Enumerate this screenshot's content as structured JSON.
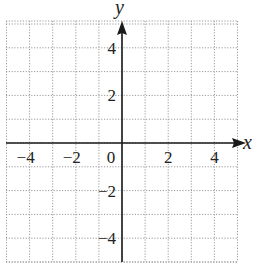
{
  "chart_data": {
    "type": "scatter",
    "title": "",
    "xlabel": "x",
    "ylabel": "y",
    "xlim": [
      -5,
      5
    ],
    "ylim": [
      -5,
      5
    ],
    "grid": true,
    "grid_style": "dotted",
    "grid_step": 1,
    "x_ticks": [
      -4,
      -2,
      0,
      2,
      4
    ],
    "x_tick_labels": [
      "−4",
      "−2",
      "0",
      "2",
      "4"
    ],
    "y_ticks": [
      4,
      2,
      -2,
      -4
    ],
    "y_tick_labels": [
      "4",
      "2",
      "−2",
      "−4"
    ],
    "series": [],
    "legend": null
  },
  "colors": {
    "axis": "#1a1a1a",
    "grid": "#9a9a9a",
    "background": "#ffffff"
  }
}
